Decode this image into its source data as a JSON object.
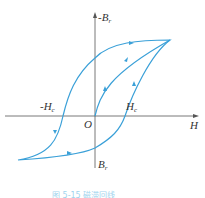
{
  "diagram": {
    "caption": "图 5-15 磁滞回线",
    "axes": {
      "x_label": "H",
      "y_label": "-B",
      "y_label_sub": "r",
      "origin_label": "O"
    },
    "points": {
      "neg_coercivity": "-H",
      "neg_coercivity_sub": "c",
      "pos_coercivity": "H",
      "pos_coercivity_sub": "c",
      "remanence": "B",
      "remanence_sub": "r"
    },
    "colors": {
      "curve": "#3aa0d8",
      "axis": "#555555",
      "caption": "#9fd4ee"
    }
  }
}
